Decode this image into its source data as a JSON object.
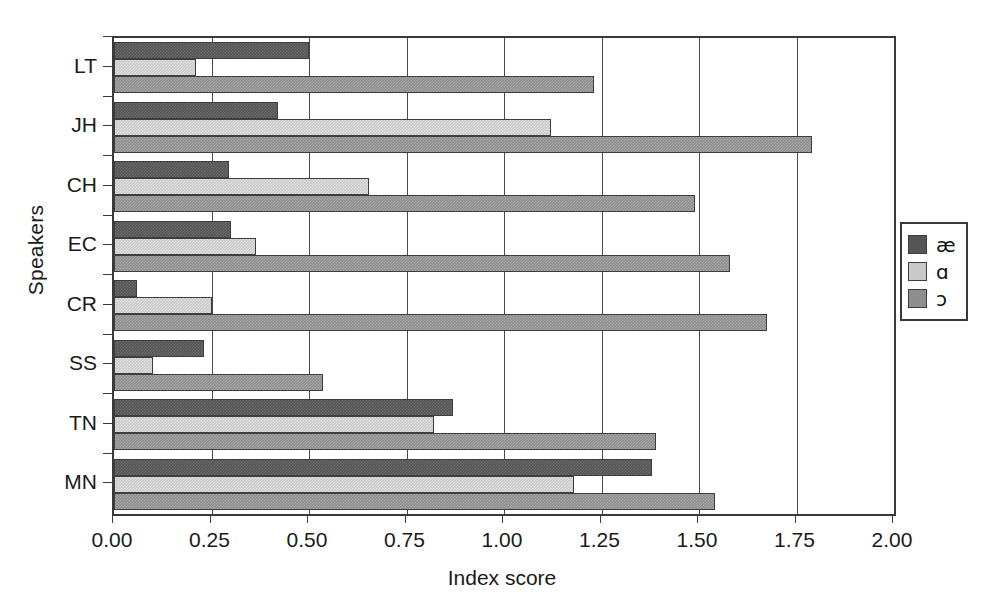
{
  "chart_data": {
    "type": "bar",
    "orientation": "horizontal",
    "title": "",
    "xlabel": "Index score",
    "ylabel": "Speakers",
    "categories": [
      "LT",
      "JH",
      "CH",
      "EC",
      "CR",
      "SS",
      "TN",
      "MN"
    ],
    "xlim": [
      0.0,
      2.0
    ],
    "xticks": [
      "0.00",
      "0.25",
      "0.50",
      "0.75",
      "1.00",
      "1.25",
      "1.50",
      "1.75",
      "2.00"
    ],
    "xtick_values": [
      0.0,
      0.25,
      0.5,
      0.75,
      1.0,
      1.25,
      1.5,
      1.75,
      2.0
    ],
    "grid": true,
    "grid_axis": "x",
    "legend_position": "right-outside",
    "series": [
      {
        "name": "ae",
        "label": "æ",
        "color": "#555555",
        "values": [
          0.5,
          0.42,
          0.295,
          0.3,
          0.06,
          0.23,
          0.87,
          1.38
        ]
      },
      {
        "name": "script-a",
        "label": "ɑ",
        "color": "#c9c9c9",
        "values": [
          0.21,
          1.12,
          0.655,
          0.365,
          0.25,
          0.1,
          0.82,
          1.18
        ]
      },
      {
        "name": "open-o",
        "label": "ɔ",
        "color": "#8e8e8e",
        "values": [
          1.23,
          1.79,
          1.49,
          1.58,
          1.675,
          0.535,
          1.39,
          1.54
        ]
      }
    ]
  }
}
